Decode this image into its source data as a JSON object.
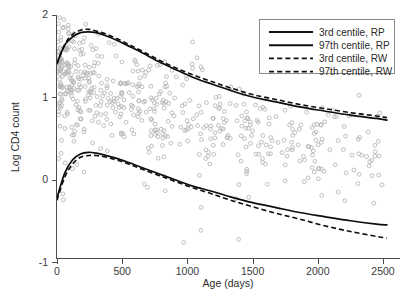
{
  "chart_data": {
    "type": "scatter",
    "title": "",
    "xlabel": "Age (days)",
    "ylabel": "Log CD4 count",
    "xlim": [
      -30,
      2560
    ],
    "ylim": [
      -1.45,
      2.25
    ],
    "xticks": [
      0,
      500,
      1000,
      1500,
      2000,
      2500
    ],
    "xtick_labels": [
      "0",
      "500",
      "1000",
      "1500",
      "2000",
      "2500"
    ],
    "yticks": [
      -1,
      0,
      1,
      2
    ],
    "ytick_labels": [
      "-1",
      "0",
      "1",
      "2"
    ],
    "grid": false,
    "legend_position": "top-right",
    "legend": [
      {
        "label": "3rd centile, RP",
        "style": "solid"
      },
      {
        "label": "97th centile, RP",
        "style": "solid"
      },
      {
        "label": "3rd centile, RW",
        "style": "dashed"
      },
      {
        "label": "97th centile, RW",
        "style": "dashed"
      }
    ],
    "colors": {
      "curve": "#0d0d0d",
      "points": "#b4b4b4",
      "axis": "#4d4d4d",
      "legend_border": "#8a8a8a",
      "background": "#ffffff"
    },
    "series": [
      {
        "name": "97th centile, RP",
        "style": "solid",
        "x": [
          0,
          60,
          120,
          180,
          240,
          300,
          380,
          470,
          560,
          660,
          780,
          900,
          1040,
          1180,
          1330,
          1500,
          1680,
          1860,
          2050,
          2250,
          2450,
          2530
        ],
        "values": [
          1.41,
          1.63,
          1.73,
          1.78,
          1.79,
          1.78,
          1.74,
          1.68,
          1.61,
          1.53,
          1.43,
          1.34,
          1.24,
          1.16,
          1.08,
          1.0,
          0.94,
          0.88,
          0.83,
          0.78,
          0.74,
          0.72
        ]
      },
      {
        "name": "97th centile, RW",
        "style": "dashed",
        "x": [
          0,
          60,
          120,
          180,
          240,
          300,
          380,
          470,
          560,
          660,
          780,
          900,
          1040,
          1180,
          1330,
          1500,
          1680,
          1860,
          2050,
          2250,
          2450,
          2530
        ],
        "values": [
          1.4,
          1.64,
          1.76,
          1.81,
          1.82,
          1.8,
          1.76,
          1.7,
          1.63,
          1.55,
          1.45,
          1.36,
          1.27,
          1.19,
          1.11,
          1.03,
          0.97,
          0.91,
          0.86,
          0.81,
          0.77,
          0.75
        ]
      },
      {
        "name": "3rd centile, RP",
        "style": "solid",
        "x": [
          0,
          60,
          120,
          180,
          240,
          300,
          380,
          470,
          560,
          660,
          780,
          900,
          1040,
          1180,
          1330,
          1500,
          1680,
          1860,
          2050,
          2250,
          2450,
          2530
        ],
        "values": [
          -0.22,
          0.08,
          0.24,
          0.31,
          0.33,
          0.32,
          0.29,
          0.25,
          0.2,
          0.14,
          0.07,
          0.0,
          -0.08,
          -0.14,
          -0.21,
          -0.28,
          -0.34,
          -0.4,
          -0.45,
          -0.5,
          -0.54,
          -0.55
        ]
      },
      {
        "name": "3rd centile, RW",
        "style": "dashed",
        "x": [
          0,
          60,
          120,
          180,
          240,
          300,
          380,
          470,
          560,
          660,
          780,
          900,
          1040,
          1180,
          1330,
          1500,
          1680,
          1860,
          2050,
          2250,
          2450,
          2530
        ],
        "values": [
          -0.25,
          0.03,
          0.19,
          0.27,
          0.29,
          0.29,
          0.27,
          0.23,
          0.18,
          0.12,
          0.05,
          -0.02,
          -0.1,
          -0.17,
          -0.25,
          -0.33,
          -0.41,
          -0.48,
          -0.56,
          -0.63,
          -0.69,
          -0.71
        ]
      }
    ],
    "scatter": {
      "name": "observations",
      "marker": "open-circle",
      "n_points": 620,
      "note": "dense cloud of child CD4 measurements, concentrated below 1200 days and between log counts 0.4 and 1.8"
    }
  }
}
